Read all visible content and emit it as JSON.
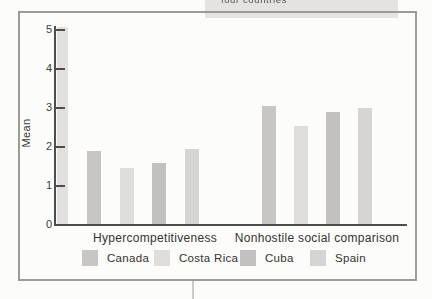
{
  "page": {
    "top_text_fragment": "four countries"
  },
  "chart_data": {
    "type": "bar",
    "title": "",
    "categories": [
      "Hypercompetitiveness",
      "Nonhostile social comparison"
    ],
    "series": [
      {
        "name": "Canada",
        "color": "#c7c6c4",
        "values": [
          1.9,
          3.05
        ]
      },
      {
        "name": "Costa Rica",
        "color": "#dfdedc",
        "values": [
          1.45,
          2.55
        ]
      },
      {
        "name": "Cuba",
        "color": "#c2c1bf",
        "values": [
          1.6,
          2.9
        ]
      },
      {
        "name": "Spain",
        "color": "#d6d5d3",
        "values": [
          1.95,
          3.0
        ]
      }
    ],
    "ylabel": "Mean",
    "ylim": [
      0,
      5
    ],
    "y_ticks": [
      0,
      1,
      2,
      3,
      4,
      5
    ],
    "legend_position": "bottom",
    "grid": false
  },
  "colors": {
    "axis": "#4f4e4c",
    "frame_border": "#9b9b99",
    "axis_strip": "#e2e1df",
    "caption_box": "#e4e3e1"
  }
}
